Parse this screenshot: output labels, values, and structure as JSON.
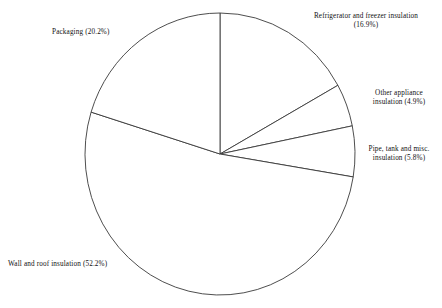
{
  "chart_data": {
    "type": "pie",
    "title": "",
    "subtitle": "",
    "xlabel": "",
    "ylabel": "",
    "legend_position": "none",
    "grid": false,
    "units": "percent",
    "start_angle_deg": 0,
    "direction": "clockwise",
    "categories": [
      "Refrigerator and freezer insulation",
      "Other appliance insulation",
      "Pipe, tank and misc. insulation",
      "Wall and roof insulation",
      "Packaging"
    ],
    "values": [
      16.9,
      4.9,
      5.8,
      52.2,
      20.2
    ],
    "slices": [
      {
        "name": "refrigerator-and-freezer-insulation",
        "label": "Refrigerator and freezer insulation",
        "percent": 16.9,
        "percent_text": "(16.9%)",
        "full_label": "Refrigerator and freezer insulation\n(16.9%)",
        "start_deg": 0.0,
        "end_deg": 60.84
      },
      {
        "name": "other-appliance-insulation",
        "label": "Other appliance insulation",
        "percent": 4.9,
        "percent_text": "(4.9%)",
        "full_label": "Other appliance\ninsulation (4.9%)",
        "start_deg": 60.84,
        "end_deg": 78.48
      },
      {
        "name": "pipe-tank-and-misc-insulation",
        "label": "Pipe, tank and misc. insulation",
        "percent": 5.8,
        "percent_text": "(5.8%)",
        "full_label": "Pipe, tank and misc.\ninsulation (5.8%)",
        "start_deg": 78.48,
        "end_deg": 99.36
      },
      {
        "name": "wall-and-roof-insulation",
        "label": "Wall and roof insulation",
        "percent": 52.2,
        "percent_text": "(52.2%)",
        "full_label": "Wall and roof insulation (52.2%)",
        "start_deg": 99.36,
        "end_deg": 287.28
      },
      {
        "name": "packaging",
        "label": "Packaging",
        "percent": 20.2,
        "percent_text": "(20.2%)",
        "full_label": "Packaging (20.2%)",
        "start_deg": 287.28,
        "end_deg": 360.0
      }
    ],
    "geometry": {
      "center_x": 220,
      "center_y": 154,
      "radius_x": 135,
      "radius_y": 141
    },
    "style": {
      "slice_fill": "#ffffff",
      "slice_stroke": "#3a3a3a",
      "text_color": "#111111",
      "background": "#ffffff"
    }
  },
  "labels": {
    "refrigerator": "Refrigerator and freezer insulation\n(16.9%)",
    "other_appliance": "Other appliance\ninsulation (4.9%)",
    "pipe_tank": "Pipe, tank and misc.\ninsulation (5.8%)",
    "wall_roof": "Wall and roof insulation (52.2%)",
    "packaging": "Packaging (20.2%)"
  }
}
